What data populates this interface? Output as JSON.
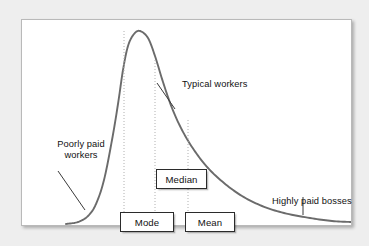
{
  "figure": {
    "background_color": "#eeeeee",
    "panel_color": "#ffffff",
    "panel_border_color": "#b9b9b9",
    "curve_color": "#6b6b6b",
    "guide_line_color": "#b0b0b0",
    "text_color": "#111111"
  },
  "annotations": {
    "poorly_paid": "Poorly paid workers",
    "typical_workers": "Typical workers",
    "highly_paid": "Highly paid bosses"
  },
  "stat_boxes": {
    "mode": "Mode",
    "median": "Median",
    "mean": "Mean"
  },
  "chart_data": {
    "type": "line",
    "title": "",
    "subtitle": "",
    "xlabel": "",
    "ylabel": "",
    "grid": false,
    "legend": "none",
    "axis_visible": false,
    "xlim": [
      0,
      331
    ],
    "ylim": [
      0,
      207
    ],
    "series": [
      {
        "name": "Income distribution",
        "color": "#6b6b6b",
        "line_width": 1.9,
        "points": [
          [
            44,
            204
          ],
          [
            56,
            202
          ],
          [
            66,
            196
          ],
          [
            74,
            184
          ],
          [
            82,
            160
          ],
          [
            90,
            120
          ],
          [
            96,
            84
          ],
          [
            101,
            50
          ],
          [
            106,
            26
          ],
          [
            112,
            14
          ],
          [
            118,
            11
          ],
          [
            126,
            18
          ],
          [
            133,
            36
          ],
          [
            141,
            62
          ],
          [
            150,
            88
          ],
          [
            160,
            110
          ],
          [
            172,
            130
          ],
          [
            186,
            148
          ],
          [
            202,
            163
          ],
          [
            220,
            176
          ],
          [
            240,
            186
          ],
          [
            262,
            193
          ],
          [
            288,
            198
          ],
          [
            310,
            201
          ],
          [
            329,
            202
          ]
        ]
      }
    ],
    "markers": [
      {
        "name": "mode",
        "label": "Mode",
        "x_panel": 102,
        "x_page": 123,
        "line_style": "dotted",
        "from_y": 11,
        "to_y": 207
      },
      {
        "name": "median",
        "label": "Median",
        "x_panel": 133,
        "x_page": 154,
        "line_style": "dotted",
        "from_y": 40,
        "to_y": 207
      },
      {
        "name": "mean",
        "label": "Mean",
        "x_panel": 166,
        "x_page": 187,
        "line_style": "dotted",
        "from_y": 100,
        "to_y": 207
      }
    ],
    "leader_lines": [
      {
        "name": "poorly-paid-leader",
        "x1": 36,
        "y1": 151,
        "x2": 63,
        "y2": 190
      },
      {
        "name": "typical-workers-leader",
        "x1": 153,
        "y1": 89,
        "x2": 135,
        "y2": 63
      },
      {
        "name": "highly-paid-leader",
        "x1": 281,
        "y1": 177,
        "x2": 281,
        "y2": 195
      }
    ]
  }
}
